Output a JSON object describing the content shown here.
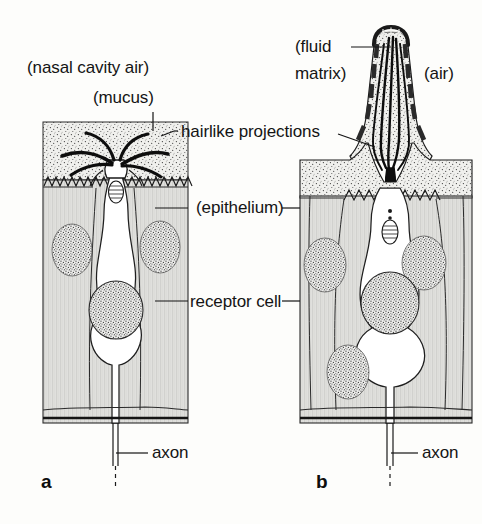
{
  "figure": {
    "background_color": "#fdfdfb",
    "ink_color": "#141414",
    "mucus_fill": "#e9e9e6",
    "epithelium_fill": "#e4e4e1",
    "nucleus_fill": "#dcdcd8"
  },
  "labels": {
    "nasal_cavity_air": "(nasal cavity air)",
    "mucus": "(mucus)",
    "hairlike_projections": "hairlike projections",
    "epithelium": "(epithelium)",
    "receptor_cell": "receptor cell",
    "axon_a": "axon",
    "axon_b": "axon",
    "fluid_matrix_line1": "(fluid",
    "fluid_matrix_line2": "matrix)",
    "air": "(air)"
  },
  "panels": [
    {
      "id": "a",
      "letter": "a",
      "kind": "vertebrate-olfactory-receptor",
      "structures": [
        "nasal cavity air",
        "mucus layer",
        "hairlike projections (cilia)",
        "microvilli border",
        "dendritic knob",
        "basal body",
        "supporting cell nuclei",
        "receptor cell nucleus",
        "basement membrane",
        "axon"
      ]
    },
    {
      "id": "b",
      "letter": "b",
      "kind": "insect-sensillum-receptor",
      "structures": [
        "air",
        "sensillum peg with pore tubules",
        "fluid matrix",
        "dendrites (hairlike projections)",
        "microvilli border",
        "basal body",
        "supporting cell nuclei",
        "receptor cell nucleus",
        "basement membrane",
        "axon"
      ]
    }
  ]
}
